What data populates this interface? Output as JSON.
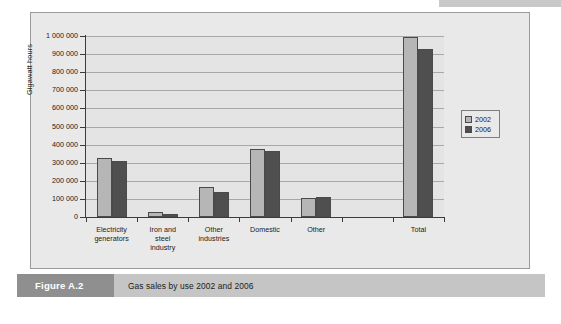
{
  "figure": {
    "tag": "Figure A.2",
    "caption": "Gas sales by use 2002 and 2006"
  },
  "chart_data": {
    "type": "bar",
    "title": "",
    "xlabel": "",
    "ylabel": "Gigawatt hours",
    "ylim": [
      0,
      1000000
    ],
    "ytick_labels": [
      "1 000 000",
      "900 000",
      "800 000",
      "700 000",
      "600 000",
      "500 000",
      "400 000",
      "300 000",
      "200 000",
      "100 000",
      "0"
    ],
    "ytick_values": [
      1000000,
      900000,
      800000,
      700000,
      600000,
      500000,
      400000,
      300000,
      200000,
      100000,
      0
    ],
    "grid": true,
    "legend_position": "right",
    "categories": [
      "Electricity\ngenerators",
      "Iron and\nsteel\nindustry",
      "Other\nindustries",
      "Domestic",
      "Other",
      "",
      "Total"
    ],
    "series": [
      {
        "name": "2002",
        "color": "#b6b6b6",
        "values": [
          328000,
          25000,
          165000,
          378000,
          105000,
          null,
          995000
        ]
      },
      {
        "name": "2006",
        "color": "#4f4f4f",
        "values": [
          310000,
          14000,
          136000,
          366000,
          111000,
          null,
          930000
        ]
      }
    ]
  },
  "legend": {
    "items": [
      {
        "label": "2002",
        "color": "#b6b6b6"
      },
      {
        "label": "2006",
        "color": "#4f4f4f"
      }
    ]
  }
}
